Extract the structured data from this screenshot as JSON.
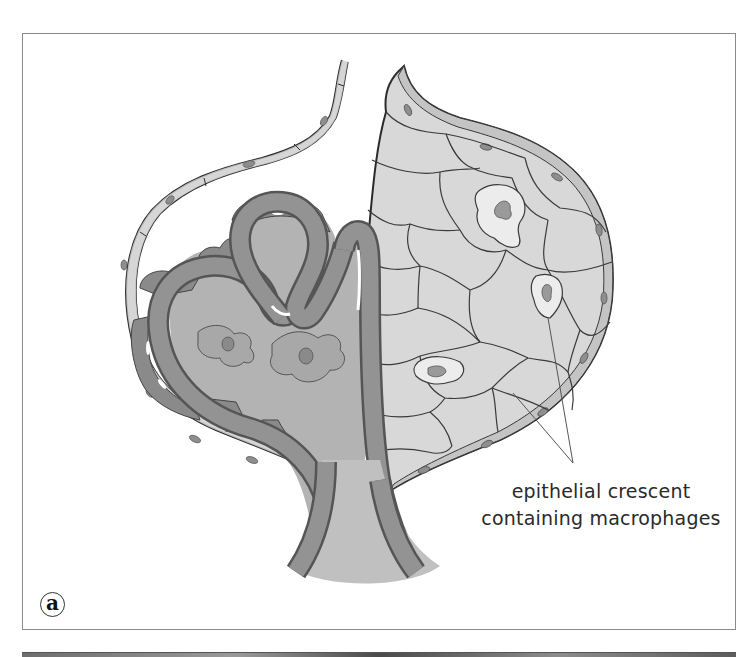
{
  "figure": {
    "panel_label": "a",
    "callout": {
      "lines": [
        "epithelial crescent",
        "containing macrophages"
      ]
    },
    "colors": {
      "capsule_outline": "#2b2b2b",
      "parietal_cell_fill": "#c9c9c9",
      "crescent_fill": "#d8d8d8",
      "crescent_cell_outline": "#3a3a3a",
      "macrophage_fill": "#ececec",
      "nucleus_fill": "#9a9a9a",
      "capillary_wall": "#8f8f8f",
      "capillary_lumen": "#b8b8b8",
      "podocyte_fill": "#8a8a8a",
      "mesangium_fill": "#b3b3b3",
      "frame_border": "#8a8a8a",
      "background": "#ffffff"
    },
    "structures": [
      "bowman-capsule",
      "parietal-epithelium",
      "epithelial-crescent",
      "macrophages",
      "capillary-loops",
      "podocytes",
      "mesangial-cells",
      "vascular-pole"
    ]
  }
}
